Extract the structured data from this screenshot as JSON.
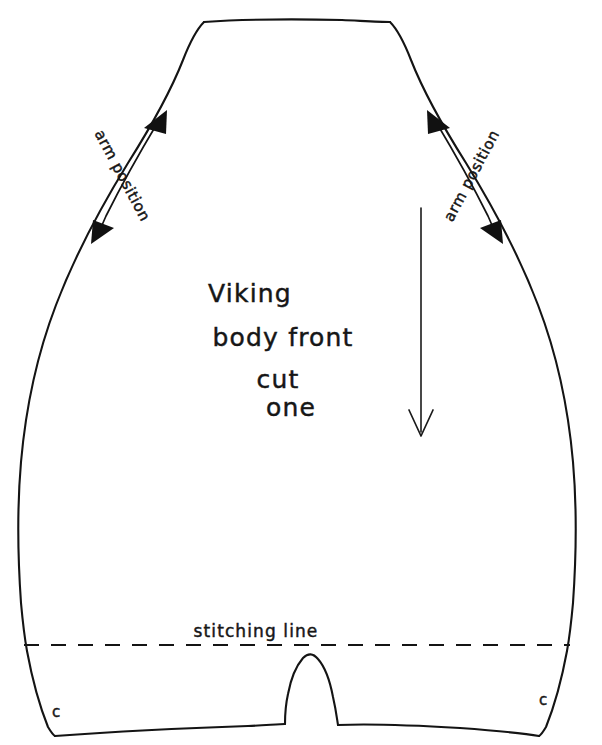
{
  "document": {
    "kind": "hand-drawn sewing pattern piece",
    "background_color": "#ffffff",
    "ink_color": "#141414",
    "width": 602,
    "height": 745
  },
  "labels": {
    "title_line_1": "Viking",
    "title_line_2": "body front",
    "title_line_3": "cut",
    "title_line_4": "one",
    "stitching_line": "stitching  line",
    "arm_position_left": "arm position",
    "arm_position_right": "arm position",
    "corner_left": "c",
    "corner_right": "c"
  },
  "markings": {
    "grainline_name": "grainline-arrow",
    "grainline_direction": "down",
    "stitching_line_style": "dashed",
    "arm_position_marker_style": "double-headed arrow",
    "notch_name": "center-bottom-notch",
    "corner_marker_name": "corner-c-mark"
  }
}
